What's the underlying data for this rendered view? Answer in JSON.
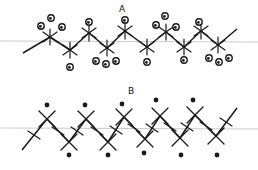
{
  "diagram": {
    "type": "polymer-chain-tacticity",
    "colors": {
      "stroke": "#1a1a1a",
      "axis": "#bdbdbd",
      "background": "#ffffff"
    },
    "panels": [
      {
        "label": "A",
        "label_pos": [
          119,
          13
        ],
        "axis_y": 41,
        "chain": [
          [
            23,
            53
          ],
          [
            50,
            37
          ],
          [
            70,
            50
          ],
          [
            89,
            33
          ],
          [
            107,
            48
          ],
          [
            125,
            31
          ],
          [
            147,
            47
          ],
          [
            166,
            32
          ],
          [
            184,
            47
          ],
          [
            201,
            31
          ],
          [
            218,
            45
          ],
          [
            237,
            29
          ]
        ],
        "substituent_style": "open-circle",
        "groups": [
          {
            "at": [
              50,
              37
            ],
            "dots": [
              [
                41,
                26
              ],
              [
                51,
                18
              ],
              [
                62,
                27
              ]
            ],
            "ticks": "star"
          },
          {
            "at": [
              70,
              50
            ],
            "dots": [
              [
                70,
                67
              ]
            ],
            "ticks": "star"
          },
          {
            "at": [
              89,
              33
            ],
            "dots": [
              [
                89,
                22
              ]
            ],
            "ticks": "star"
          },
          {
            "at": [
              107,
              48
            ],
            "dots": [
              [
                96,
                61
              ],
              [
                106,
                64
              ],
              [
                116,
                61
              ]
            ],
            "ticks": "star"
          },
          {
            "at": [
              125,
              31
            ],
            "dots": [
              [
                125,
                20
              ]
            ],
            "ticks": "star"
          },
          {
            "at": [
              147,
              47
            ],
            "dots": [
              [
                147,
                62
              ]
            ],
            "ticks": "star"
          },
          {
            "at": [
              166,
              32
            ],
            "dots": [
              [
                156,
                25
              ],
              [
                165,
                16
              ],
              [
                176,
                27
              ]
            ],
            "ticks": "star"
          },
          {
            "at": [
              184,
              47
            ],
            "dots": [
              [
                184,
                60
              ]
            ],
            "ticks": "star"
          },
          {
            "at": [
              201,
              31
            ],
            "dots": [
              [
                199,
                22
              ]
            ],
            "ticks": "star"
          },
          {
            "at": [
              218,
              45
            ],
            "dots": [
              [
                209,
                58
              ],
              [
                219,
                62
              ],
              [
                229,
                58
              ]
            ],
            "ticks": "star"
          }
        ]
      },
      {
        "label": "B",
        "label_pos": [
          128,
          95
        ],
        "axis_y": 128,
        "chain": [
          [
            22,
            150
          ],
          [
            47,
            119
          ],
          [
            69,
            142
          ],
          [
            86,
            119
          ],
          [
            108,
            142
          ],
          [
            124,
            117
          ],
          [
            145,
            139
          ],
          [
            160,
            116
          ],
          [
            180,
            138
          ],
          [
            195,
            115
          ],
          [
            216,
            136
          ],
          [
            237,
            108
          ]
        ],
        "substituent_style": "filled-dot",
        "groups": [
          {
            "at": [
              47,
              119
            ],
            "dots": [
              [
                47,
                105
              ]
            ],
            "ticks": "cross"
          },
          {
            "at": [
              69,
              142
            ],
            "dots": [
              [
                69,
                155
              ]
            ],
            "ticks": "cross"
          },
          {
            "at": [
              86,
              119
            ],
            "dots": [
              [
                85,
                105
              ]
            ],
            "ticks": "cross"
          },
          {
            "at": [
              108,
              142
            ],
            "dots": [
              [
                108,
                155
              ]
            ],
            "ticks": "cross"
          },
          {
            "at": [
              124,
              117
            ],
            "dots": [
              [
                122,
                104
              ]
            ],
            "ticks": "cross"
          },
          {
            "at": [
              145,
              139
            ],
            "dots": [
              [
                144,
                153
              ]
            ],
            "ticks": "cross"
          },
          {
            "at": [
              160,
              116
            ],
            "dots": [
              [
                156,
                100
              ]
            ],
            "ticks": "cross"
          },
          {
            "at": [
              180,
              138
            ],
            "dots": [
              [
                181,
                155
              ]
            ],
            "ticks": "cross"
          },
          {
            "at": [
              195,
              115
            ],
            "dots": [
              [
                193,
                100
              ]
            ],
            "ticks": "cross"
          },
          {
            "at": [
              216,
              136
            ],
            "dots": [
              [
                217,
                155
              ]
            ],
            "ticks": "cross"
          }
        ],
        "mid_ticks": [
          [
            34,
            135
          ],
          [
            58,
            131
          ],
          [
            77,
            131
          ],
          [
            97,
            131
          ],
          [
            116,
            130
          ],
          [
            134,
            128
          ],
          [
            152,
            128
          ],
          [
            170,
            127
          ],
          [
            187,
            127
          ],
          [
            206,
            126
          ],
          [
            226,
            122
          ]
        ]
      }
    ]
  }
}
